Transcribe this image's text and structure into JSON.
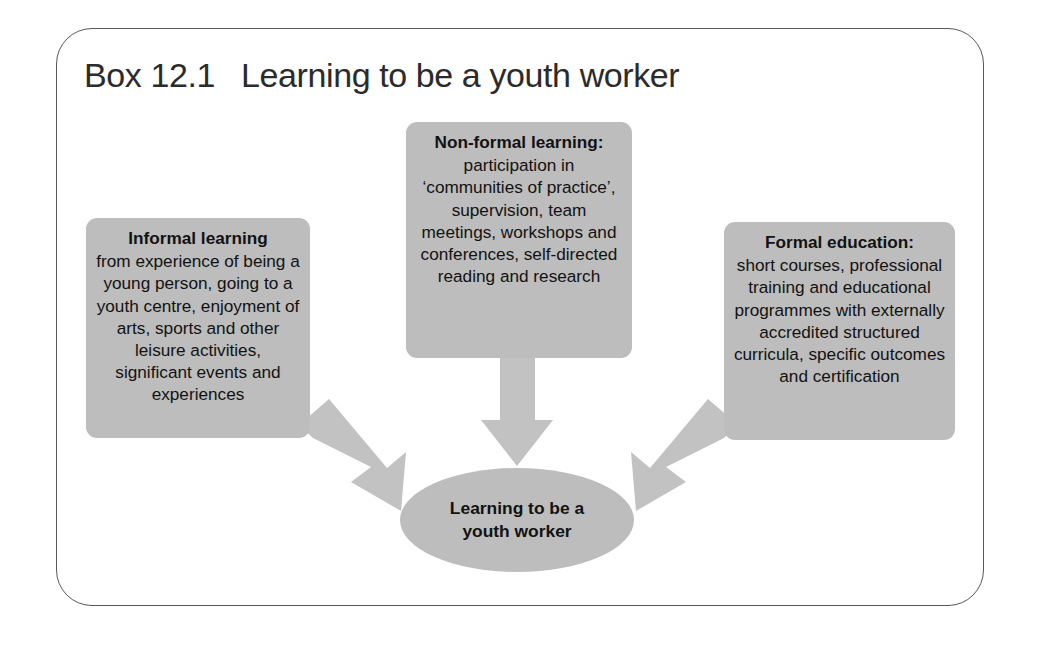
{
  "figure": {
    "title_label": "Box 12.1",
    "title_text": "Learning to be a youth worker",
    "frame_color": "#58585a",
    "box_fill_color": "#bdbdbd",
    "arrow_color": "#c2c2c2",
    "text_color": "#121212"
  },
  "diagram": {
    "type": "flow",
    "nodes": [
      {
        "id": "informal",
        "heading": "Informal learning",
        "body": "from experience of being a young person, going to a youth centre, enjoyment of arts, sports and other leisure activities, significant events and experiences"
      },
      {
        "id": "nonformal",
        "heading": "Non-formal learning:",
        "body": "participation in ‘communities of practice’, supervision, team meetings, workshops and conferences, self-directed reading and research"
      },
      {
        "id": "formal",
        "heading": "Formal education:",
        "body": "short courses, professional training and educational programmes with externally accredited structured curricula, specific outcomes and certification"
      }
    ],
    "target": {
      "id": "outcome",
      "line1": "Learning to be a",
      "line2": "youth worker"
    },
    "arrows": [
      {
        "id": "informal-to-outcome",
        "direction": "down-right"
      },
      {
        "id": "nonformal-to-outcome",
        "direction": "down"
      },
      {
        "id": "formal-to-outcome",
        "direction": "down-left"
      }
    ]
  }
}
